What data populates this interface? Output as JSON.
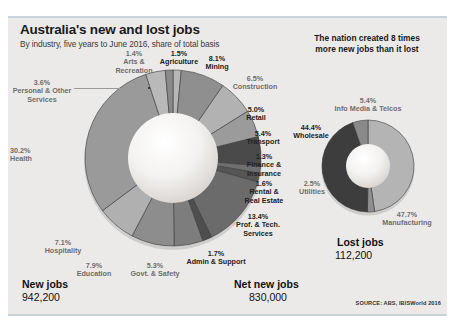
{
  "header": {
    "title": "Australia's new and lost jobs",
    "subtitle": "By industry, five years to June 2016, share of total basis",
    "kicker_line1": "The nation created 8 times",
    "kicker_line2": "more new jobs than it lost"
  },
  "footer": {
    "source": "SOURCE: ABS, IBISWorld 2016"
  },
  "totals": {
    "new_jobs_label": "New jobs",
    "new_jobs_value": "942,200",
    "lost_jobs_label": "Lost jobs",
    "lost_jobs_value": "112,200",
    "net_new_jobs_label": "Net new jobs",
    "net_new_jobs_value": "830,000"
  },
  "chart_data": [
    {
      "type": "pie",
      "title": "New jobs",
      "total": "942,200",
      "categories": [
        "Agriculture",
        "Mining",
        "Construction",
        "Retail",
        "Transport",
        "Finance & Insurance",
        "Rental & Real Estate",
        "Prof. & Tech. Services",
        "Admin & Support",
        "Govt. & Safety",
        "Education",
        "Hospitality",
        "Health",
        "Personal & Other Services",
        "Arts & Recreation"
      ],
      "values": [
        1.5,
        8.1,
        6.5,
        5.0,
        5.4,
        1.3,
        1.6,
        13.4,
        1.7,
        5.3,
        7.9,
        7.1,
        30.2,
        3.6,
        1.4
      ],
      "value_labels": [
        "1.5%",
        "8.1%",
        "6.5%",
        "5.0%",
        "5.4%",
        "1.3%",
        "1.6%",
        "13.4%",
        "1.7%",
        "5.3%",
        "7.9%",
        "7.1%",
        "30.2%",
        "3.6%",
        "1.4%"
      ],
      "colors": [
        "#b7b7b7",
        "#8f8f8f",
        "#b2b2b2",
        "#9b9b9b",
        "#4a4a4a",
        "#6f6f6f",
        "#565656",
        "#6b6b6b",
        "#4e4e4e",
        "#7d7d7d",
        "#8d8d8d",
        "#b0b0b0",
        "#9a9a9a",
        "#b9b9b9",
        "#8a8a8a"
      ]
    },
    {
      "type": "pie",
      "title": "Lost jobs",
      "total": "112,200",
      "categories": [
        "Manufacturing",
        "Utilities",
        "Wholesale",
        "Info Media & Telcos"
      ],
      "values": [
        47.7,
        2.5,
        44.4,
        5.4
      ],
      "value_labels": [
        "47.7%",
        "2.5%",
        "44.4%",
        "5.4%"
      ],
      "colors": [
        "#b4b4b4",
        "#8f8f8f",
        "#3d3d3d",
        "#8a8a8a"
      ]
    }
  ],
  "left_labels": [
    {
      "pct": "1.4%",
      "name_1": "Arts &",
      "name_2": "Recreation"
    },
    {
      "pct": "1.5%",
      "name_1": "Agriculture",
      "name_2": ""
    },
    {
      "pct": "8.1%",
      "name_1": "Mining",
      "name_2": ""
    },
    {
      "pct": "6.5%",
      "name_1": "Construction",
      "name_2": ""
    },
    {
      "pct": "5.0%",
      "name_1": "Retail",
      "name_2": ""
    },
    {
      "pct": "5.4%",
      "name_1": "Transport",
      "name_2": ""
    },
    {
      "pct": "1.3%",
      "name_1": "Finance &",
      "name_2": "Insurance"
    },
    {
      "pct": "1.6%",
      "name_1": "Rental &",
      "name_2": "Real Estate"
    },
    {
      "pct": "13.4%",
      "name_1": "Prof. & Tech.",
      "name_2": "Services"
    },
    {
      "pct": "1.7%",
      "name_1": "Admin & Support",
      "name_2": ""
    },
    {
      "pct": "5.3%",
      "name_1": "Govt. & Safety",
      "name_2": ""
    },
    {
      "pct": "7.9%",
      "name_1": "Education",
      "name_2": ""
    },
    {
      "pct": "7.1%",
      "name_1": "Hospitality",
      "name_2": ""
    },
    {
      "pct": "30.2%",
      "name_1": "Health",
      "name_2": ""
    },
    {
      "pct": "3.6%",
      "name_1": "Personal & Other",
      "name_2": "Services"
    }
  ],
  "right_labels": [
    {
      "pct": "5.4%",
      "name_1": "Info Media & Telcos"
    },
    {
      "pct": "44.4%",
      "name_1": "Wholesale"
    },
    {
      "pct": "2.5%",
      "name_1": "Utilities"
    },
    {
      "pct": "47.7%",
      "name_1": "Manufacturing"
    }
  ]
}
